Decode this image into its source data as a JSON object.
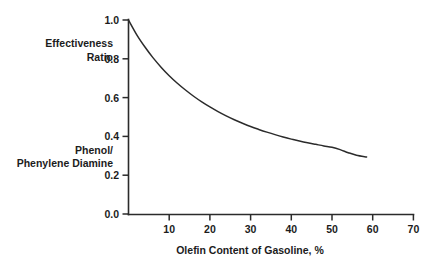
{
  "chart_data": {
    "type": "line",
    "title": "",
    "xlabel": "Olefin Content of Gasoline, %",
    "ylabel": "",
    "y_axis_labels": [
      "Effectiveness",
      "Ratio",
      "Phenol/",
      "Phenylene Diamine"
    ],
    "xlim": [
      0,
      70
    ],
    "ylim": [
      0.0,
      1.0
    ],
    "grid": false,
    "legend": "none",
    "xticks": [
      0,
      10,
      20,
      30,
      40,
      50,
      60,
      70
    ],
    "xtick_labels": [
      "",
      "10",
      "20",
      "30",
      "40",
      "50",
      "60",
      "70"
    ],
    "yticks": [
      0.0,
      0.2,
      0.4,
      0.6,
      0.8,
      1.0
    ],
    "ytick_labels": [
      "0.0",
      "0.2",
      "0.4",
      "0.6",
      "0.8",
      "1.0"
    ],
    "line_color": "#2b2b2b",
    "background_color": "#ffffff",
    "series": [
      {
        "name": "Effectiveness Ratio (Phenol/Phenylene Diamine)",
        "x": [
          0,
          2,
          4,
          6,
          8,
          10,
          12,
          14,
          16,
          18,
          20,
          22,
          24,
          26,
          28,
          30,
          32,
          34,
          36,
          38,
          40,
          42,
          44,
          46,
          48,
          50,
          52,
          54,
          56,
          58.5
        ],
        "y": [
          1.0,
          0.925,
          0.862,
          0.806,
          0.757,
          0.713,
          0.674,
          0.639,
          0.607,
          0.578,
          0.552,
          0.528,
          0.506,
          0.486,
          0.468,
          0.451,
          0.436,
          0.422,
          0.409,
          0.397,
          0.386,
          0.376,
          0.367,
          0.359,
          0.351,
          0.344,
          0.332,
          0.316,
          0.303,
          0.294
        ]
      }
    ],
    "asymptote": 0.29,
    "annotations": []
  },
  "labels": {
    "effectiveness": "Effectiveness",
    "ratio": "Ratio",
    "phenol": "Phenol/",
    "phenylene_diamine": "Phenylene Diamine",
    "x_axis_title": "Olefin Content of Gasoline, %"
  }
}
